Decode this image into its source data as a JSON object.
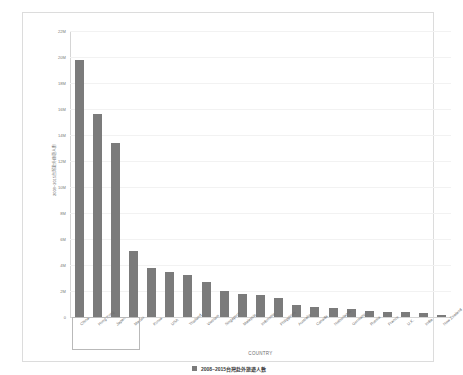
{
  "chart_data": {
    "type": "bar",
    "title": "",
    "subtitle": "",
    "xlabel": "COUNTRY",
    "ylabel": "2008~2015台灣赴外旅遊人數",
    "ylim": [
      0,
      22000000
    ],
    "ytick_labels": [
      "0",
      "2M",
      "4M",
      "6M",
      "8M",
      "10M",
      "12M",
      "14M",
      "16M",
      "18M",
      "20M",
      "22M"
    ],
    "ytick_values": [
      0,
      2000000,
      4000000,
      6000000,
      8000000,
      10000000,
      12000000,
      14000000,
      16000000,
      18000000,
      20000000,
      22000000
    ],
    "grid": true,
    "legend_position": "bottom",
    "legend": [
      {
        "label": "2008~2015台灣赴外旅遊人數",
        "color": "#7b7b7b"
      }
    ],
    "bar_color": "#7b7b7b",
    "categories": [
      "China",
      "Hong Kong",
      "Japan",
      "Macau",
      "Korea",
      "USA",
      "Thailand",
      "Vietnam",
      "Singapore",
      "Malaysia",
      "Indonesia",
      "Philippines",
      "Australia",
      "Canada",
      "Netherlands",
      "Germany",
      "Russia",
      "France",
      "U.K.",
      "India",
      "New Zealand"
    ],
    "values": [
      19800000,
      15600000,
      13400000,
      5100000,
      3800000,
      3500000,
      3200000,
      2700000,
      2000000,
      1800000,
      1700000,
      1500000,
      900000,
      800000,
      700000,
      650000,
      450000,
      400000,
      350000,
      300000,
      150000
    ],
    "selection": {
      "type": "rectangle",
      "selected_categories": [
        "China",
        "Hong Kong",
        "Japan"
      ]
    }
  }
}
